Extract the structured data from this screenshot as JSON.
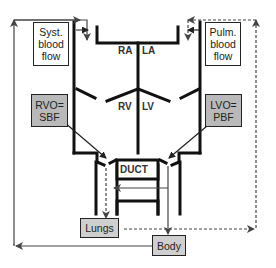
{
  "diagram": {
    "type": "fetal circulation schematic",
    "chambers": {
      "ra": "RA",
      "la": "LA",
      "rv": "RV",
      "lv": "LV"
    },
    "duct": "DUCT",
    "boxes": {
      "syst_blood_flow": [
        "Syst.",
        "blood",
        "flow"
      ],
      "pulm_blood_flow": [
        "Pulm.",
        "blood",
        "flow"
      ],
      "rvo": [
        "RVO=",
        "SBF"
      ],
      "lvo": [
        "LVO=",
        "PBF"
      ],
      "lungs": "Lungs",
      "body": "Body"
    },
    "colors": {
      "line": "#222222",
      "arrow": "#555555",
      "rvo_box": "#b9b9b9",
      "lungs_body_box": "#cfcfcf"
    },
    "flows": [
      {
        "from": "Body",
        "to": "Systemic venous return (RA)",
        "style": "solid"
      },
      {
        "from": "Lungs",
        "to": "Pulmonary venous return (LA)",
        "style": "dashed"
      },
      {
        "from": "RV",
        "to": "Lungs",
        "style": "dashed"
      },
      {
        "from": "LV",
        "to": "Body",
        "style": "solid"
      },
      {
        "from": "Aorta",
        "to": "Pulmonary via duct",
        "style": "solid"
      }
    ]
  }
}
